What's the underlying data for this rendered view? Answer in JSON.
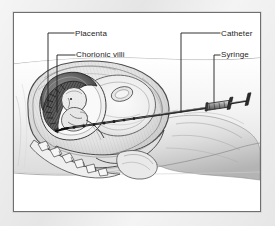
{
  "figure": {
    "kind": "medical-illustration",
    "background_color": "#e9e9e9",
    "panel_color": "#ffffff",
    "frame_color": "#6f6f6f",
    "ink_color": "#1c1c1c"
  },
  "labels": {
    "placenta": "Placenta",
    "chorionic_villi": "Chorionic villi",
    "catheter": "Catheter",
    "syringe": "Syringe"
  },
  "anatomy": {
    "maternal_abdomen": "maternal-abdomen",
    "uterus": "uterus",
    "amniotic_sac": "amniotic-sac",
    "fetus": "fetus",
    "placenta_mass": "placenta",
    "chorionic_villi_band": "chorionic-villi",
    "cervix": "cervix",
    "spine_vertebrae": "spine-vertebrae",
    "bladder": "bladder"
  },
  "instrument": {
    "needle": "needle",
    "catheter_tube": "catheter-tube",
    "syringe_barrel": "syringe-barrel",
    "syringe_plunger": "syringe-plunger",
    "syringe_flange": "syringe-flange"
  },
  "leaders": {
    "placenta": "leader-placenta",
    "chorionic_villi": "leader-chorionic-villi",
    "catheter": "leader-catheter",
    "syringe": "leader-syringe"
  }
}
